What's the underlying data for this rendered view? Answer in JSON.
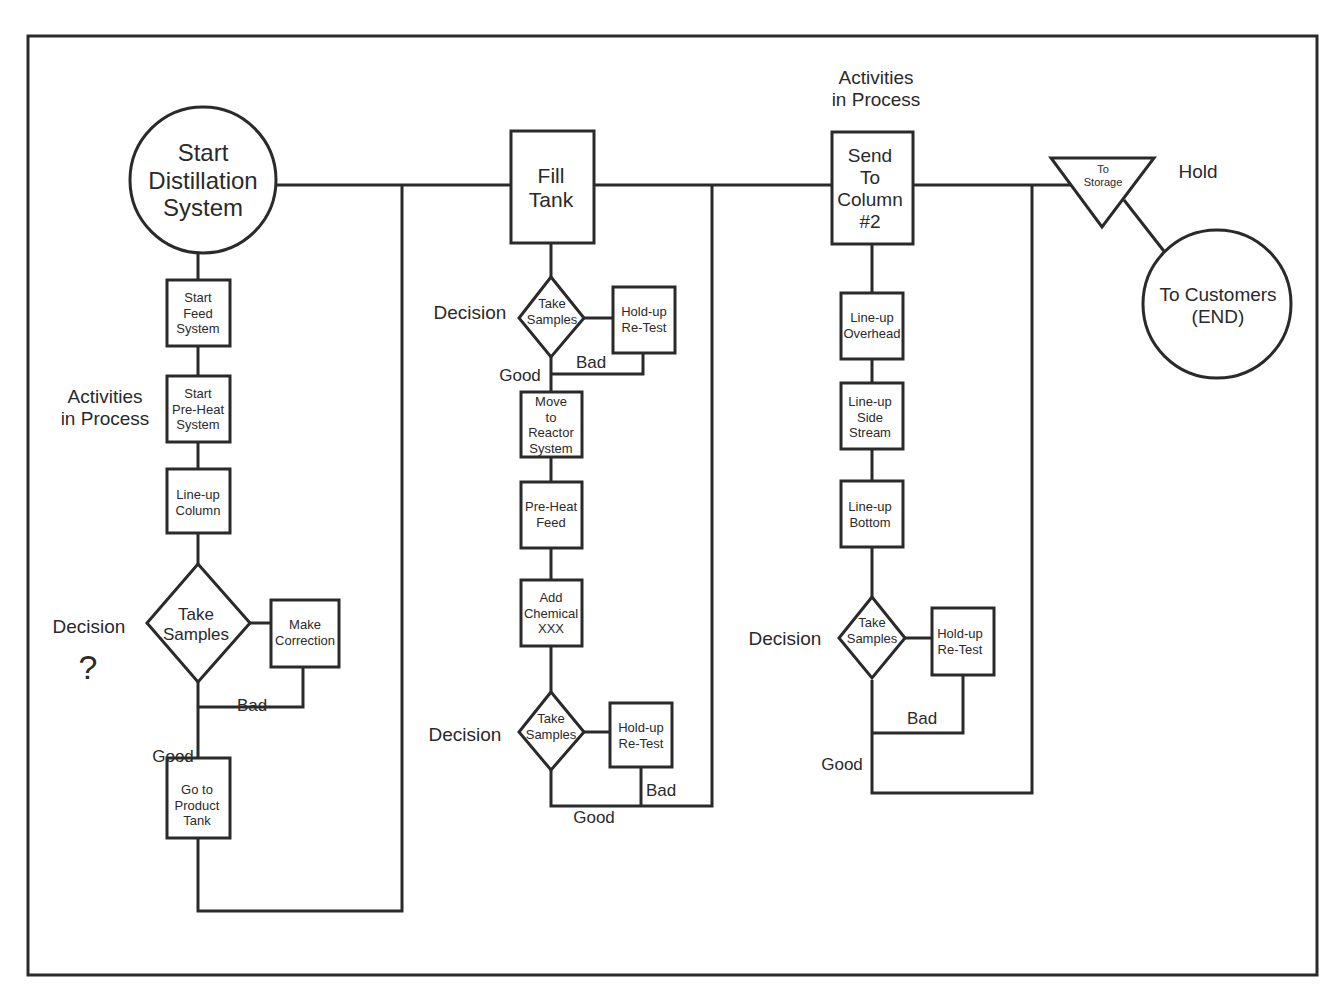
{
  "diagram": {
    "colors": {
      "line": "#2a2a2a",
      "background": "#ffffff"
    },
    "start": {
      "label": "Start\nDistillation\nSystem",
      "shape": "circle"
    },
    "end": {
      "label": "To Customers\n(END)",
      "shape": "circle"
    },
    "hold": {
      "label": "To\nStorage",
      "shape": "inverted-triangle",
      "annotation": "Hold"
    },
    "annotations": {
      "activities_left": "Activities\nin Process",
      "activities_top": "Activities\nin Process",
      "decision_left": "Decision",
      "decision_question": "?",
      "decision_mid_top": "Decision",
      "decision_mid_bottom": "Decision",
      "decision_right": "Decision"
    },
    "column1": {
      "steps": [
        "Start\nFeed\nSystem",
        "Start\nPre-Heat\nSystem",
        "Line-up\nColumn"
      ],
      "decision": "Take\nSamples",
      "correction": "Make\nCorrection",
      "bad": "Bad",
      "good": "Good",
      "final": "Go to\nProduct\nTank"
    },
    "column2": {
      "header": "Fill\nTank",
      "decision1": "Take\nSamples",
      "retest1": "Hold-up\nRe-Test",
      "bad1": "Bad",
      "good1": "Good",
      "steps": [
        "Move\nto\nReactor\nSystem",
        "Pre-Heat\nFeed",
        "Add\nChemical\nXXX"
      ],
      "decision2": "Take\nSamples",
      "retest2": "Hold-up\nRe-Test",
      "bad2": "Bad",
      "good2": "Good"
    },
    "column3": {
      "header": "Send\nTo\nColumn\n#2",
      "steps": [
        "Line-up\nOverhead",
        "Line-up\nSide\nStream",
        "Line-up\nBottom"
      ],
      "decision": "Take\nSamples",
      "retest": "Hold-up\nRe-Test",
      "bad": "Bad",
      "good": "Good"
    }
  }
}
